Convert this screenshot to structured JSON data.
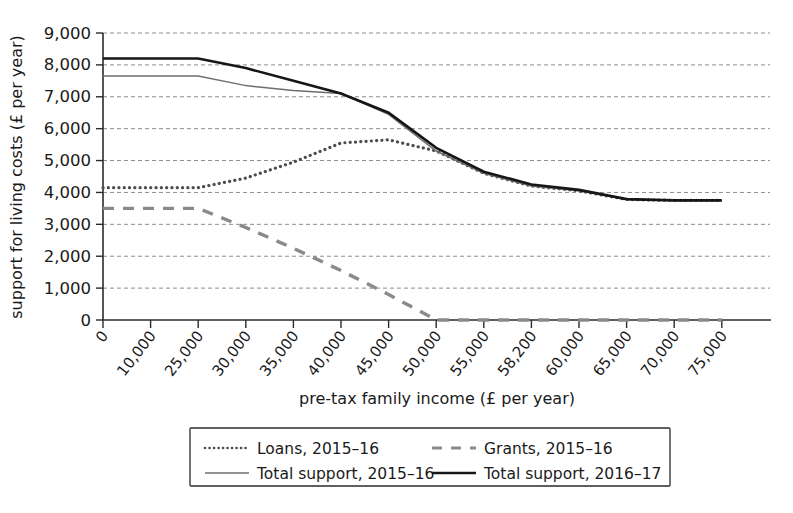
{
  "chart_data": {
    "type": "line",
    "title": "",
    "xlabel": "pre-tax family income (£ per year)",
    "ylabel": "support for living costs (£ per year)",
    "categories": [
      "0",
      "10,000",
      "25,000",
      "30,000",
      "35,000",
      "40,000",
      "45,000",
      "50,000",
      "55,000",
      "58,200",
      "60,000",
      "65,000",
      "70,000",
      "75,000"
    ],
    "x_values": [
      0,
      10000,
      25000,
      30000,
      35000,
      40000,
      45000,
      50000,
      55000,
      58200,
      60000,
      65000,
      70000,
      75000
    ],
    "ylim": [
      0,
      9000
    ],
    "y_ticks": [
      0,
      1000,
      2000,
      3000,
      4000,
      5000,
      6000,
      7000,
      8000,
      9000
    ],
    "y_tick_labels": [
      "0",
      "1,000",
      "2,000",
      "3,000",
      "4,000",
      "5,000",
      "6,000",
      "7,000",
      "8,000",
      "9,000"
    ],
    "grid": true,
    "grid_axis": "y",
    "legend_position": "below-center",
    "series": [
      {
        "name": "Loans, 2015–16",
        "style": "dotted",
        "color": "#4d4d4d",
        "values": [
          4150,
          4150,
          4150,
          4450,
          4950,
          5550,
          5650,
          5300,
          4600,
          4200,
          4050,
          3780,
          3750,
          3750
        ]
      },
      {
        "name": "Grants, 2015–16",
        "style": "dashed",
        "color": "#8a8a8a",
        "values": [
          3500,
          3500,
          3500,
          2900,
          2250,
          1550,
          800,
          0,
          0,
          0,
          0,
          0,
          0,
          0
        ]
      },
      {
        "name": "Total support, 2015–16",
        "style": "solid-thin",
        "color": "#6e6e6e",
        "values": [
          7650,
          7650,
          7650,
          7350,
          7200,
          7100,
          6450,
          5300,
          4600,
          4200,
          4050,
          3780,
          3750,
          3750
        ]
      },
      {
        "name": "Total support, 2016–17",
        "style": "solid-thick",
        "color": "#161616",
        "values": [
          8200,
          8200,
          8200,
          7900,
          7500,
          7100,
          6500,
          5400,
          4650,
          4250,
          4080,
          3790,
          3750,
          3750
        ]
      }
    ]
  },
  "legend": {
    "entries": [
      {
        "label": "Loans, 2015–16",
        "key": "loans"
      },
      {
        "label": "Grants, 2015–16",
        "key": "grants"
      },
      {
        "label": "Total support, 2015–16",
        "key": "total1516"
      },
      {
        "label": "Total support, 2016–17",
        "key": "total1617"
      }
    ]
  },
  "axes": {
    "x_title": "pre-tax family income (£ per year)",
    "y_title": "support for living costs (£ per year)"
  }
}
